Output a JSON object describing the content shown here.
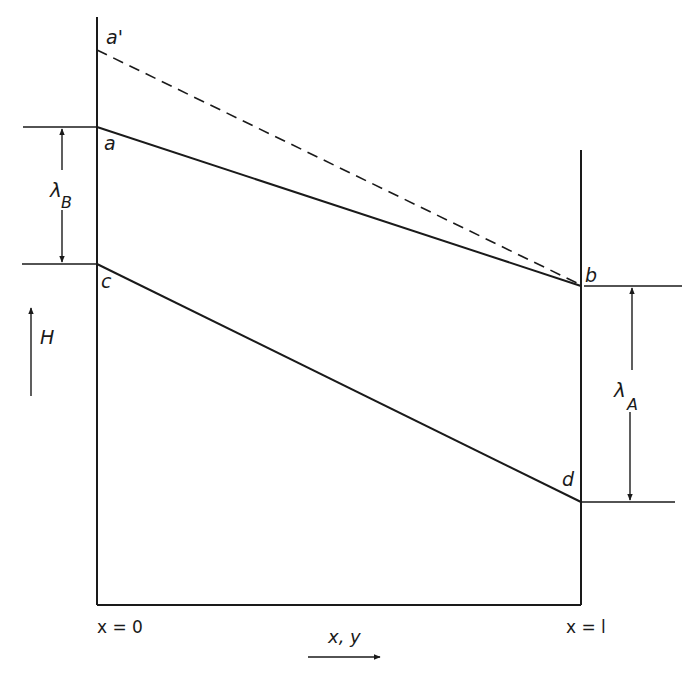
{
  "diagram": {
    "points": {
      "a_prime": "a'",
      "a": "a",
      "b": "b",
      "c": "c",
      "d": "d"
    },
    "dimensions": {
      "lambda_B": {
        "symbol": "λ",
        "subscript": "B"
      },
      "lambda_A": {
        "symbol": "λ",
        "subscript": "A"
      }
    },
    "axis": {
      "vertical_label": "H",
      "horizontal_label": "x, y",
      "left_boundary": "x = 0",
      "right_boundary": "x = l"
    },
    "lines": [
      {
        "name": "a-prime-to-b",
        "style": "dashed",
        "from": "a'",
        "to": "b"
      },
      {
        "name": "a-to-b",
        "style": "solid",
        "from": "a",
        "to": "b"
      },
      {
        "name": "c-to-d",
        "style": "solid",
        "from": "c",
        "to": "d"
      }
    ],
    "colors": {
      "stroke": "#1a1a1a",
      "background": "#ffffff"
    }
  }
}
